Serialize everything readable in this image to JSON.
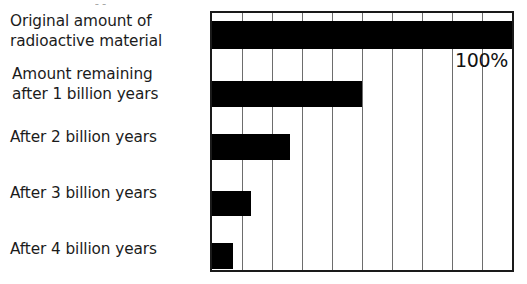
{
  "title_sliver": "y",
  "value_annotation": "100%",
  "axis": {
    "min_percent": 0,
    "max_percent": 100,
    "gridline_step_percent": 10
  },
  "categories": [
    "Original amount of\nradioactive material",
    "Amount remaining\nafter 1 billion years",
    "After 2 billion years",
    "After 3 billion years",
    "After 4 billion years"
  ],
  "chart_data": {
    "type": "bar",
    "orientation": "horizontal",
    "title": "",
    "xlabel": "",
    "ylabel": "",
    "xlim": [
      0,
      100
    ],
    "grid": true,
    "gridline_step": 10,
    "legend": "none",
    "bar_color": "#000000",
    "frame_color": "#1a1a1a",
    "gridline_color": "#6d6d6d",
    "categories": [
      "Original amount of radioactive material",
      "Amount remaining after 1 billion years",
      "After 2 billion years",
      "After 3 billion years",
      "After 4 billion years"
    ],
    "values": [
      100,
      50,
      26,
      13,
      7
    ],
    "annotations": [
      {
        "text": "100%",
        "category": "Original amount of radioactive material",
        "position": "inside-right-below-bar"
      }
    ]
  },
  "bars": [
    {
      "label": "Original amount of radioactive material",
      "percent": 100,
      "top_px": 8,
      "height_px": 28
    },
    {
      "label": "Amount remaining after 1 billion years",
      "percent": 50,
      "top_px": 68,
      "height_px": 26
    },
    {
      "label": "After 2 billion years",
      "percent": 26,
      "top_px": 121,
      "height_px": 26
    },
    {
      "label": "After 3 billion years",
      "percent": 13,
      "top_px": 178,
      "height_px": 25
    },
    {
      "label": "After 4 billion years",
      "percent": 7,
      "top_px": 230,
      "height_px": 26
    }
  ],
  "gridlines_percent": [
    10,
    20,
    30,
    40,
    50,
    60,
    70,
    80,
    90
  ]
}
